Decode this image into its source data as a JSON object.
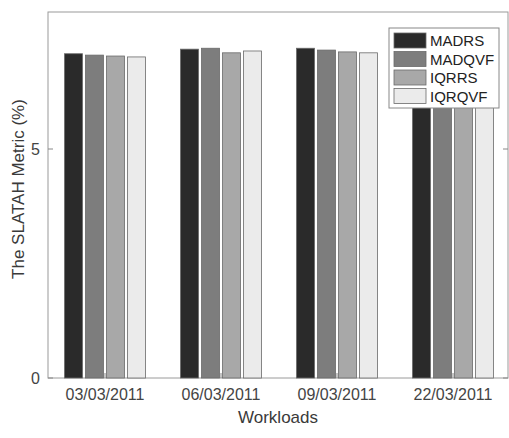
{
  "chart_data": {
    "type": "bar",
    "title": "",
    "xlabel": "Workloads",
    "ylabel": "The SLATAH Metric (%)",
    "categories": [
      "03/03/2011",
      "06/03/2011",
      "09/03/2011",
      "22/03/2011"
    ],
    "series": [
      {
        "name": "MADRS",
        "color": "#2a2a2a",
        "values": [
          7.08,
          7.18,
          7.2,
          7.15
        ]
      },
      {
        "name": "MADQVF",
        "color": "#7d7d7d",
        "values": [
          7.05,
          7.2,
          7.16,
          7.12
        ]
      },
      {
        "name": "IQRRS",
        "color": "#a8a8a8",
        "values": [
          7.03,
          7.1,
          7.12,
          7.1
        ]
      },
      {
        "name": "IQRQVF",
        "color": "#ebebeb",
        "values": [
          7.01,
          7.14,
          7.1,
          7.08
        ]
      }
    ],
    "yticks": [
      0,
      5
    ],
    "ylim": [
      0,
      8
    ],
    "grid": false,
    "legend_position": "upper right"
  }
}
